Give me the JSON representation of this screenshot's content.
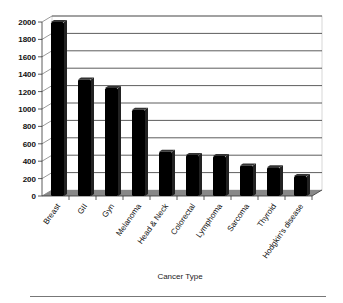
{
  "chart_data": {
    "type": "bar",
    "title": "",
    "xlabel": "Cancer Type",
    "ylabel": "",
    "categories": [
      "Breast",
      "GII",
      "Gyn",
      "Melanoma",
      "Head & Neck",
      "Colorectal",
      "Lymphoma",
      "Sarcoma",
      "Thyroid",
      "Hodgkin's disease"
    ],
    "values": [
      2000,
      1340,
      1240,
      990,
      510,
      470,
      460,
      350,
      330,
      230
    ],
    "ylim": [
      0,
      2000
    ],
    "yticks": [
      0,
      200,
      400,
      600,
      800,
      1000,
      1200,
      1400,
      1600,
      1800,
      2000
    ],
    "grid": true,
    "legend": "none",
    "style": "3d-bar",
    "colors": {
      "bar": "#000000",
      "floor": "#888888",
      "grid": "#333333",
      "wall": "#ffffff"
    }
  }
}
